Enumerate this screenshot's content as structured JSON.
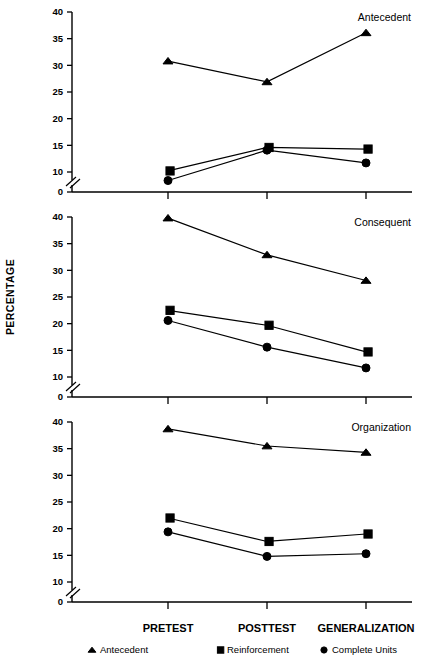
{
  "figure": {
    "y_axis_title": "PERCENTAGE",
    "categories": [
      "PRETEST",
      "POSTTEST",
      "GENERALIZATION"
    ],
    "y_ticks": [
      "0",
      "10",
      "15",
      "20",
      "25",
      "30",
      "35",
      "40"
    ],
    "axis_break": true,
    "accent_color": "#000000",
    "background_color": "#ffffff"
  },
  "legend": {
    "position": "bottom",
    "items": [
      {
        "label": "Antecedent",
        "marker": "triangle-marker"
      },
      {
        "label": "Reinforcement",
        "marker": "square-marker"
      },
      {
        "label": "Complete Units",
        "marker": "circle-marker"
      }
    ]
  },
  "chart_data": [
    {
      "type": "line",
      "title": "Antecedent",
      "xlabel": "",
      "ylabel": "PERCENTAGE",
      "categories": [
        "PRETEST",
        "POSTTEST",
        "GENERALIZATION"
      ],
      "ylim": [
        0,
        40
      ],
      "yticks": [
        0,
        10,
        15,
        20,
        25,
        30,
        35,
        40
      ],
      "grid": false,
      "axis_break_between": [
        0,
        10
      ],
      "series": [
        {
          "name": "Antecedent",
          "marker": "triangle",
          "values": [
            30.8,
            26.9,
            36.1
          ]
        },
        {
          "name": "Reinforcement",
          "marker": "square",
          "values": [
            10.2,
            14.6,
            14.3
          ]
        },
        {
          "name": "Complete Units",
          "marker": "circle",
          "values": [
            8.4,
            14.1,
            11.7
          ]
        }
      ]
    },
    {
      "type": "line",
      "title": "Consequent",
      "xlabel": "",
      "ylabel": "PERCENTAGE",
      "categories": [
        "PRETEST",
        "POSTTEST",
        "GENERALIZATION"
      ],
      "ylim": [
        0,
        40
      ],
      "yticks": [
        0,
        10,
        15,
        20,
        25,
        30,
        35,
        40
      ],
      "grid": false,
      "axis_break_between": [
        0,
        10
      ],
      "series": [
        {
          "name": "Antecedent",
          "marker": "triangle",
          "values": [
            39.8,
            32.9,
            28.1
          ]
        },
        {
          "name": "Reinforcement",
          "marker": "square",
          "values": [
            22.5,
            19.7,
            14.7
          ]
        },
        {
          "name": "Complete Units",
          "marker": "circle",
          "values": [
            20.6,
            15.6,
            11.7
          ]
        }
      ]
    },
    {
      "type": "line",
      "title": "Organization",
      "xlabel": "",
      "ylabel": "PERCENTAGE",
      "categories": [
        "PRETEST",
        "POSTTEST",
        "GENERALIZATION"
      ],
      "ylim": [
        0,
        40
      ],
      "yticks": [
        0,
        10,
        15,
        20,
        25,
        30,
        35,
        40
      ],
      "grid": false,
      "axis_break_between": [
        0,
        10
      ],
      "series": [
        {
          "name": "Antecedent",
          "marker": "triangle",
          "values": [
            38.7,
            35.5,
            34.3
          ]
        },
        {
          "name": "Reinforcement",
          "marker": "square",
          "values": [
            22.0,
            17.6,
            19.0
          ]
        },
        {
          "name": "Complete Units",
          "marker": "circle",
          "values": [
            19.4,
            14.8,
            15.3
          ]
        }
      ]
    }
  ]
}
